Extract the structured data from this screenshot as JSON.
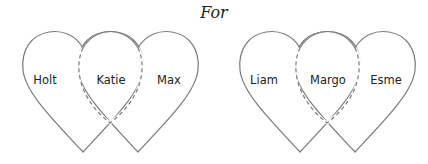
{
  "title": "For",
  "groups": [
    {
      "left_label": "Holt",
      "middle_label": "Katie",
      "right_label": "Max"
    },
    {
      "left_label": "Liam",
      "middle_label": "Margo",
      "right_label": "Esme"
    }
  ],
  "colors": {
    "stroke": "#7a7a7a",
    "text": "#222222"
  }
}
